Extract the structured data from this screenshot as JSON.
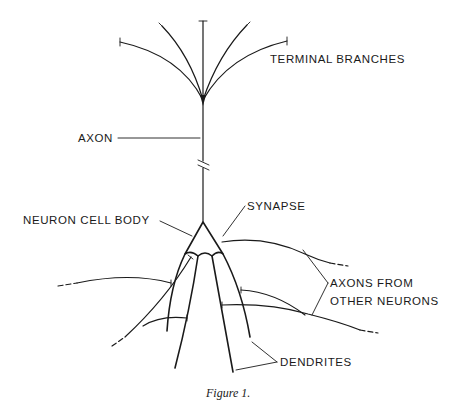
{
  "figure": {
    "caption": "Figure 1.",
    "labels": {
      "terminal_branches": "TERMINAL BRANCHES",
      "axon": "AXON",
      "neuron_cell_body": "NEURON CELL BODY",
      "synapse": "SYNAPSE",
      "axons_from_line1": "AXONS FROM",
      "axons_from_line2": "OTHER NEURONS",
      "dendrites": "DENDRITES"
    },
    "colors": {
      "ink": "#1a1a1a",
      "background": "#ffffff",
      "cell_body_fill": "#c8c8c8"
    }
  }
}
